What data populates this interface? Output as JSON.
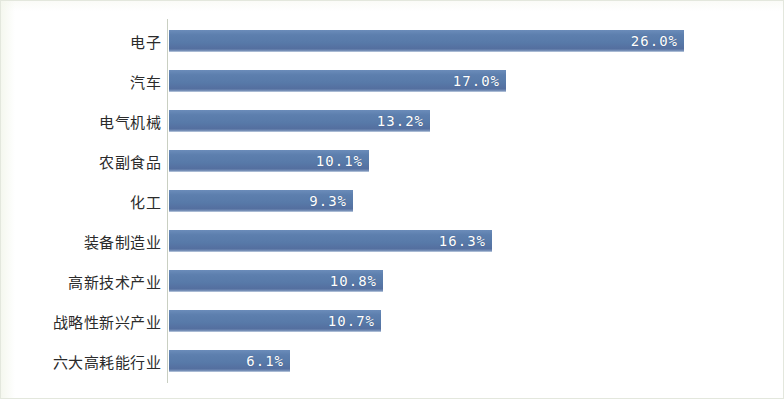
{
  "chart_data": {
    "type": "bar",
    "orientation": "horizontal",
    "title": "",
    "subtitle": "",
    "xlabel": "",
    "ylabel": "",
    "grid": false,
    "legend": null,
    "axis_line": true,
    "value_suffix": "%",
    "xlim": [
      0,
      26.0
    ],
    "categories": [
      "电子",
      "汽车",
      "电气机械",
      "农副食品",
      "化工",
      "装备制造业",
      "高新技术产业",
      "战略性新兴产业",
      "六大高耗能行业"
    ],
    "values": [
      26.0,
      17.0,
      13.2,
      10.1,
      9.3,
      16.3,
      10.8,
      10.7,
      6.1
    ],
    "labels": [
      "26.0%",
      "17.0%",
      "13.2%",
      "10.1%",
      "9.3%",
      "16.3%",
      "10.8%",
      "10.7%",
      "6.1%"
    ],
    "bars": [
      {
        "category": "电子",
        "value": 26.0,
        "label": "26.0%"
      },
      {
        "category": "汽车",
        "value": 17.0,
        "label": "17.0%"
      },
      {
        "category": "电气机械",
        "value": 13.2,
        "label": "13.2%"
      },
      {
        "category": "农副食品",
        "value": 10.1,
        "label": "10.1%"
      },
      {
        "category": "化工",
        "value": 9.3,
        "label": "9.3%"
      },
      {
        "category": "装备制造业",
        "value": 16.3,
        "label": "16.3%"
      },
      {
        "category": "高新技术产业",
        "value": 10.8,
        "label": "10.8%"
      },
      {
        "category": "战略性新兴产业",
        "value": 10.7,
        "label": "10.7%"
      },
      {
        "category": "六大高耗能行业",
        "value": 6.1,
        "label": "6.1%"
      }
    ],
    "colors": {
      "bar": "#5b7fb4",
      "bar_highlight": "#6b8cba",
      "bar_shadow": "#546f9f",
      "value_text": "#ffffff",
      "category_text": "#2b2b2b",
      "axis_line": "#c9cfc2",
      "frame_border": "#e3e7dd",
      "background": "#ffffff"
    }
  }
}
